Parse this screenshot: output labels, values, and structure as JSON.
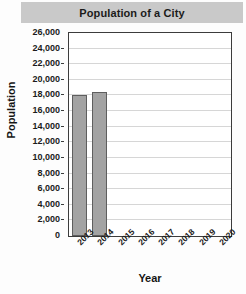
{
  "chart_data": {
    "type": "bar",
    "title": "Population of a City",
    "xlabel": "Year",
    "ylabel": "Population",
    "categories": [
      "2013",
      "2014",
      "2015",
      "2016",
      "2017",
      "2018",
      "2019",
      "2020"
    ],
    "values": [
      18000,
      18400,
      null,
      null,
      null,
      null,
      null,
      null
    ],
    "ylim": [
      0,
      26000
    ],
    "ytick_step": 2000,
    "yticks": [
      0,
      2000,
      4000,
      6000,
      8000,
      10000,
      12000,
      14000,
      16000,
      18000,
      20000,
      22000,
      24000,
      26000
    ],
    "ytick_labels": [
      "0",
      "2,000",
      "4,000",
      "6,000",
      "8,000",
      "10,000",
      "12,000",
      "14,000",
      "16,000",
      "18,000",
      "20,000",
      "22,000",
      "24,000",
      "26,000"
    ],
    "grid": true,
    "legend": false,
    "bar_color": "#a3a3a3",
    "bar_edge_color": "#5e5e5e",
    "title_band_color": "#c9c9c9",
    "plot_border_color": "#3c3c3c",
    "gridline_color": "#d6d6d6",
    "xtick_rotation": -45
  }
}
